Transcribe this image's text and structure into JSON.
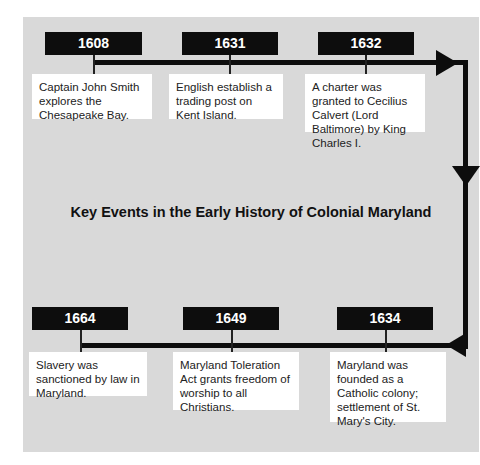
{
  "title": "Key Events in the Early History of Colonial Maryland",
  "colors": {
    "panel": "#d9d9d9",
    "box": "#0d0d0d",
    "card": "#ffffff",
    "line": "#0d0d0d"
  },
  "top_events": [
    {
      "year": "1608",
      "text": "Captain John Smith explores the Chesapeake Bay."
    },
    {
      "year": "1631",
      "text": "English establish a trading post on Kent Island."
    },
    {
      "year": "1632",
      "text": "A charter was granted to Cecilius Calvert (Lord Baltimore) by King Charles I."
    }
  ],
  "bottom_events": [
    {
      "year": "1664",
      "text": "Slavery was sanctioned by law in Maryland."
    },
    {
      "year": "1649",
      "text": "Maryland Toleration Act grants freedom of worship to all Christians."
    },
    {
      "year": "1634",
      "text": "Maryland was founded as a Catholic colony; settlement of St. Mary's City."
    }
  ]
}
